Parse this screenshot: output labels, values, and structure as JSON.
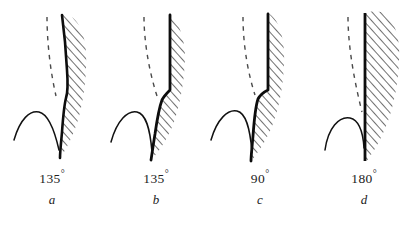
{
  "figure": {
    "title": "",
    "background_color": "#ffffff",
    "ink_color": "#111111",
    "hatch_color": "#1a1a1a",
    "panel_count": 4
  },
  "panels": [
    {
      "id": "a",
      "letter": "a",
      "angle_value": "135",
      "angle_text": "135",
      "degree_symbol": "°",
      "elements": {
        "hatched_region": "hatched-solid-region",
        "thick_boundary": "thick-interface-curve",
        "dashed_reference": "dashed-reference-line",
        "meniscus_arc": "meniscus-arc"
      }
    },
    {
      "id": "b",
      "letter": "b",
      "angle_value": "135",
      "angle_text": "135",
      "degree_symbol": "°",
      "elements": {
        "hatched_region": "hatched-solid-region",
        "thick_boundary": "thick-interface-curve",
        "dashed_reference": "dashed-reference-line",
        "meniscus_arc": "meniscus-arc"
      }
    },
    {
      "id": "c",
      "letter": "c",
      "angle_value": "90",
      "angle_text": "90",
      "degree_symbol": "°",
      "elements": {
        "hatched_region": "hatched-solid-region",
        "thick_boundary": "thick-interface-curve",
        "dashed_reference": "dashed-reference-line",
        "meniscus_arc": "meniscus-arc"
      }
    },
    {
      "id": "d",
      "letter": "d",
      "angle_value": "180",
      "angle_text": "180",
      "degree_symbol": "°",
      "elements": {
        "hatched_region": "hatched-solid-region",
        "thick_boundary": "thick-interface-line-straight",
        "dashed_reference": "dashed-reference-line",
        "meniscus_arc": "meniscus-arc"
      }
    }
  ]
}
